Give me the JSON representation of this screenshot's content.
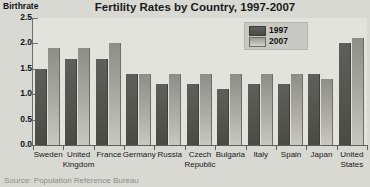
{
  "chart_data": {
    "type": "bar",
    "title": "Fertility Rates by Country, 1997-2007",
    "xlabel": "",
    "ylabel": "Birthrate",
    "ylim": [
      0,
      2.5
    ],
    "ytick_labels": [
      "0.0",
      "0.5",
      "1.0",
      "1.5",
      "2.0",
      "2.5"
    ],
    "ytick_values": [
      0,
      0.5,
      1,
      1.5,
      2,
      2.5
    ],
    "grid": false,
    "legend_position": "top-right",
    "categories": [
      "Sweden",
      "United Kingdom",
      "France",
      "Germany",
      "Russia",
      "Czech Republic",
      "Bulgaria",
      "Italy",
      "Spain",
      "Japan",
      "United States"
    ],
    "category_lines": [
      [
        "Sweden",
        ""
      ],
      [
        "United",
        "Kingdom"
      ],
      [
        "France",
        ""
      ],
      [
        "Germany",
        ""
      ],
      [
        "Russia",
        ""
      ],
      [
        "Czech",
        "Republic"
      ],
      [
        "Bulgaria",
        ""
      ],
      [
        "Italy",
        ""
      ],
      [
        "Spain",
        ""
      ],
      [
        "Japan",
        ""
      ],
      [
        "United",
        "States"
      ]
    ],
    "series": [
      {
        "name": "1997",
        "color": "#52524d",
        "values": [
          1.5,
          1.7,
          1.7,
          1.4,
          1.2,
          1.2,
          1.1,
          1.2,
          1.2,
          1.4,
          2.0
        ]
      },
      {
        "name": "2007",
        "color": "#b0b0a9",
        "values": [
          1.9,
          1.9,
          2.0,
          1.4,
          1.4,
          1.4,
          1.4,
          1.4,
          1.4,
          1.3,
          2.1
        ]
      }
    ],
    "source": "Source: Population Reference Bureau"
  }
}
